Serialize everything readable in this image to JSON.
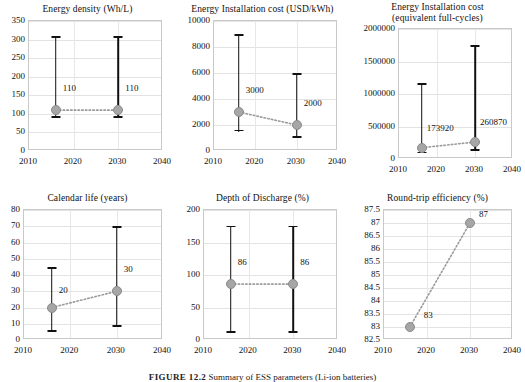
{
  "figure": {
    "caption_label": "FIGURE 12.2",
    "caption_text": "Summary of ESS parameters (Li-ion batteries)"
  },
  "chart_data": [
    {
      "type": "scatter",
      "title": "Energy density (Wh/L)",
      "xlabel": "",
      "ylabel": "",
      "xlim": [
        2010,
        2040
      ],
      "ylim": [
        0,
        350
      ],
      "xticks": [
        2010,
        2020,
        2030,
        2040
      ],
      "yticks": [
        0,
        50,
        100,
        150,
        200,
        250,
        300,
        350
      ],
      "grid": true,
      "legend": "none",
      "x": [
        2016,
        2030
      ],
      "values": [
        110,
        110
      ],
      "labels": [
        "110",
        "110"
      ],
      "err_low": [
        90,
        90
      ],
      "err_high": [
        310,
        310
      ]
    },
    {
      "type": "scatter",
      "title": "Energy Installation cost (USD/kWh)",
      "xlabel": "",
      "ylabel": "",
      "xlim": [
        2010,
        2040
      ],
      "ylim": [
        0,
        10000
      ],
      "xticks": [
        2010,
        2020,
        2030,
        2040
      ],
      "yticks": [
        0,
        2000,
        4000,
        6000,
        8000,
        10000
      ],
      "grid": true,
      "legend": "none",
      "x": [
        2016,
        2030
      ],
      "values": [
        3000,
        2000
      ],
      "labels": [
        "3000",
        "2000"
      ],
      "err_low": [
        1500,
        1000
      ],
      "err_high": [
        9000,
        6000
      ]
    },
    {
      "type": "scatter",
      "title": "Energy Installation cost",
      "title2": "(equivalent full-cycles)",
      "xlabel": "",
      "ylabel": "",
      "xlim": [
        2010,
        2040
      ],
      "ylim": [
        0,
        2000000
      ],
      "xticks": [
        2010,
        2020,
        2030,
        2040
      ],
      "yticks": [
        0,
        500000,
        1000000,
        1500000,
        2000000
      ],
      "grid": true,
      "legend": "none",
      "x": [
        2016,
        2030
      ],
      "values": [
        173920,
        260870
      ],
      "labels": [
        "173920",
        "260870"
      ],
      "err_low": [
        87000,
        130000
      ],
      "err_high": [
        1170000,
        1750000
      ]
    },
    {
      "type": "scatter",
      "title": "Calendar life (years)",
      "xlabel": "",
      "ylabel": "",
      "xlim": [
        2010,
        2040
      ],
      "ylim": [
        0,
        80
      ],
      "xticks": [
        2010,
        2020,
        2030,
        2040
      ],
      "yticks": [
        0,
        10,
        20,
        30,
        40,
        50,
        60,
        70,
        80
      ],
      "grid": true,
      "legend": "none",
      "x": [
        2016,
        2030
      ],
      "values": [
        20,
        30
      ],
      "labels": [
        "20",
        "30"
      ],
      "err_low": [
        5,
        8
      ],
      "err_high": [
        45,
        70
      ]
    },
    {
      "type": "scatter",
      "title": "Depth of Discharge (%)",
      "xlabel": "",
      "ylabel": "",
      "xlim": [
        2010,
        2040
      ],
      "ylim": [
        0,
        200
      ],
      "xticks": [
        2010,
        2020,
        2030,
        2040
      ],
      "yticks": [
        0,
        50,
        100,
        150,
        200
      ],
      "grid": true,
      "legend": "none",
      "x": [
        2016,
        2030
      ],
      "values": [
        86,
        86
      ],
      "labels": [
        "86",
        "86"
      ],
      "err_low": [
        11,
        11
      ],
      "err_high": [
        176,
        176
      ]
    },
    {
      "type": "scatter",
      "title": "Round-trip efficiency (%)",
      "xlabel": "",
      "ylabel": "",
      "xlim": [
        2010,
        2040
      ],
      "ylim": [
        82.5,
        87.5
      ],
      "xticks": [
        2010,
        2020,
        2030,
        2040
      ],
      "yticks": [
        82.5,
        83,
        83.5,
        84,
        84.5,
        85,
        85.5,
        86,
        86.5,
        87,
        87.5
      ],
      "grid": true,
      "legend": "none",
      "x": [
        2016,
        2030
      ],
      "values": [
        83,
        87
      ],
      "labels": [
        "83",
        "87"
      ],
      "err_low": [
        null,
        null
      ],
      "err_high": [
        null,
        null
      ]
    }
  ],
  "style": {
    "marker_color": "#a6a6a6",
    "bar_color": "#111111",
    "grid_color": "#e3e3e3",
    "connector_color": "#9a9a9a"
  }
}
